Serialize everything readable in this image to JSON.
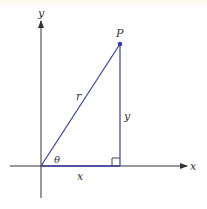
{
  "figure": {
    "type": "polar-coordinates-triangle",
    "labels": {
      "y_axis": "y",
      "x_axis": "x",
      "point": "P",
      "hypotenuse": "r",
      "opposite_side": "y",
      "adjacent_side": "x",
      "angle": "θ"
    },
    "colors": {
      "axis": "#333333",
      "triangle": "#3a3fa0",
      "point": "#2f3fb0",
      "text": "#333333"
    },
    "geometry": {
      "origin": [
        41,
        166
      ],
      "point_P": [
        120,
        44
      ]
    }
  }
}
